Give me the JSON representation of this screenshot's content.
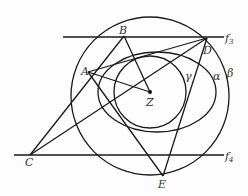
{
  "diagram": {
    "points": {
      "A": {
        "label": "A",
        "x": 88,
        "y": 72
      },
      "B": {
        "label": "B",
        "x": 124,
        "y": 36
      },
      "C": {
        "label": "C",
        "x": 30,
        "y": 155
      },
      "D": {
        "label": "D",
        "x": 207,
        "y": 38
      },
      "E": {
        "label": "E",
        "x": 163,
        "y": 176
      },
      "Z": {
        "label": "Z",
        "x": 150,
        "y": 92
      }
    },
    "curves": {
      "gamma": {
        "label": "γ",
        "type": "circle",
        "cx": 150,
        "cy": 92,
        "r": 36
      },
      "alpha": {
        "label": "α",
        "type": "ellipse",
        "cx": 157,
        "cy": 92,
        "rx": 59,
        "ry": 40
      },
      "beta": {
        "label": "β",
        "type": "circle",
        "cx": 150,
        "cy": 96,
        "r": 79
      }
    },
    "lines": {
      "f3": {
        "label": "f",
        "sub": "3"
      },
      "f4": {
        "label": "f",
        "sub": "4"
      }
    }
  }
}
